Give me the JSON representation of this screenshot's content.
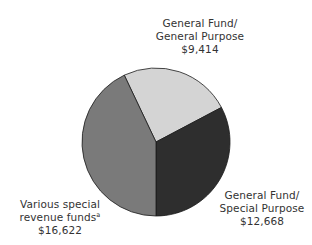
{
  "chart_data": {
    "type": "pie",
    "title": "",
    "total": 38704,
    "slices": [
      {
        "name": "General Fund/General Purpose",
        "label_lines": [
          "General Fund/",
          "General Purpose"
        ],
        "value": 9414,
        "display_value": "$9,414",
        "color": "#d4d4d4"
      },
      {
        "name": "General Fund/Special Purpose",
        "label_lines": [
          "General Fund/",
          "Special Purpose"
        ],
        "value": 12668,
        "display_value": "$12,668",
        "color": "#2e2e2e"
      },
      {
        "name": "Various special revenue funds",
        "label_lines": [
          "Various special",
          "revenue funds"
        ],
        "footnote_marker": "a",
        "value": 16622,
        "display_value": "$16,622",
        "color": "#7a7a7a"
      }
    ],
    "start_angle_deg_clockwise_from_top": 334.6,
    "legend": "none (direct labels)",
    "units": "$"
  },
  "labels": {
    "gp": {
      "line1": "General Fund/",
      "line2": "General Purpose",
      "value": "$9,414"
    },
    "sp": {
      "line1": "General Fund/",
      "line2": "Special Purpose",
      "value": "$12,668"
    },
    "vs": {
      "line1": "Various special",
      "line2": "revenue funds",
      "marker": "a",
      "value": "$16,622"
    }
  }
}
